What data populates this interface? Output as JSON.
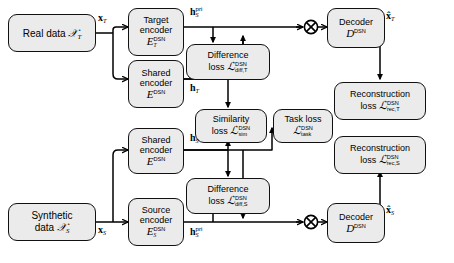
{
  "figure": {
    "type": "architecture-diagram",
    "background_color": "#ffffff",
    "node_fill": "#ebebeb",
    "node_stroke": "#111111"
  },
  "nodes": {
    "real_data": {
      "line1": "Real data",
      "symbol": "X",
      "sub": "T"
    },
    "target_encoder": {
      "line1": "Target",
      "line2": "encoder",
      "symbol": "E",
      "sub": "T",
      "sup": "DSN"
    },
    "shared_encoder_top": {
      "line1": "Shared",
      "line2": "encoder",
      "symbol": "E",
      "sup": "DSN"
    },
    "difference_loss_top": {
      "line1": "Difference",
      "line2": "loss",
      "symbol": "L",
      "sup": "DSN",
      "sub": "diff,T"
    },
    "similarity_loss": {
      "line1": "Similarity",
      "line2": "loss",
      "symbol": "L",
      "sup": "DSN",
      "sub": "sim"
    },
    "task_loss": {
      "line1": "Task loss",
      "symbol": "L",
      "sup": "DSN",
      "sub": "task"
    },
    "difference_loss_bottom": {
      "line1": "Difference",
      "line2": "loss",
      "symbol": "L",
      "sup": "DSN",
      "sub": "diff,S"
    },
    "shared_encoder_bottom": {
      "line1": "Shared",
      "line2": "encoder",
      "symbol": "E",
      "sup": "DSN"
    },
    "source_encoder": {
      "line1": "Source",
      "line2": "encoder",
      "symbol": "E",
      "sub": "S",
      "sup": "DSN"
    },
    "synthetic_data": {
      "line1": "Synthetic",
      "line2": "data",
      "symbol": "X",
      "sub": "S"
    },
    "decoder_top": {
      "line1": "Decoder",
      "symbol": "D",
      "sup": "DSN"
    },
    "decoder_bottom": {
      "line1": "Decoder",
      "symbol": "D",
      "sup": "DSN"
    },
    "reconstruction_loss_top": {
      "line1": "Reconstruction",
      "line2": "loss",
      "symbol": "L",
      "sup": "DSN",
      "sub": "rec,T"
    },
    "reconstruction_loss_bottom": {
      "line1": "Reconstruction",
      "line2": "loss",
      "symbol": "L",
      "sup": "DSN",
      "sub": "rec,S"
    }
  },
  "edge_labels": {
    "x_target": {
      "symbol": "x",
      "sub": "T"
    },
    "x_source": {
      "symbol": "x",
      "sub": "S"
    },
    "h_pri_top": {
      "symbol": "h",
      "sup": "pri",
      "sub": "S"
    },
    "h_pri_bottom": {
      "symbol": "h",
      "sup": "pri",
      "sub": "S"
    },
    "h_target": {
      "symbol": "h",
      "sub": "T"
    },
    "h_source": {
      "symbol": "h",
      "sub": "S"
    },
    "xhat_target": {
      "symbol": "x̂",
      "sub": "T"
    },
    "xhat_source": {
      "symbol": "x̂",
      "sub": "S"
    }
  },
  "operators": {
    "sum_top": "⊕",
    "sum_bottom": "⊕"
  }
}
